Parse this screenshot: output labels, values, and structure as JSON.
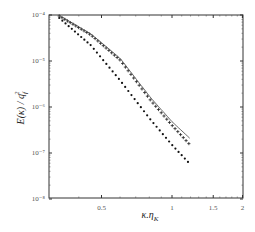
{
  "chart_data": {
    "type": "line",
    "title": "",
    "xlabel": "κ.η_K",
    "ylabel": "E(κ) / q_f^2",
    "xscale": "log",
    "yscale": "log",
    "xlim": [
      0.3,
      2
    ],
    "ylim": [
      1e-08,
      0.0001
    ],
    "x_ticks": [
      0.5,
      1,
      1.5,
      2
    ],
    "x_tick_labels": [
      "0.5",
      "1",
      "1.5",
      "2"
    ],
    "y_ticks": [
      0.0001,
      1e-05,
      1e-06,
      1e-07,
      1e-08
    ],
    "y_tick_labels": [
      "10⁻⁴",
      "10⁻⁵",
      "10⁻⁶",
      "10⁻⁷",
      "10⁻⁸"
    ],
    "grid": false,
    "legend": null,
    "series": [
      {
        "name": "crosses",
        "marker": "+",
        "x": [
          0.33,
          0.45,
          0.6,
          0.81,
          1.0,
          1.18
        ],
        "values": [
          9.5e-05,
          3.7e-05,
          1.05e-05,
          1.4e-06,
          4e-07,
          1.6e-07
        ]
      },
      {
        "name": "solid line",
        "marker": "none",
        "x": [
          0.33,
          0.45,
          0.6,
          0.81,
          1.0,
          1.19
        ],
        "values": [
          9.8e-05,
          3.9e-05,
          1.15e-05,
          1.6e-06,
          4.8e-07,
          2.1e-07
        ]
      },
      {
        "name": "dots",
        "marker": ".",
        "x": [
          0.33,
          0.45,
          0.6,
          0.81,
          1.0,
          1.17
        ],
        "values": [
          8.6e-05,
          2.2e-05,
          3.8e-06,
          5.3e-07,
          1.5e-07,
          6.4e-08
        ]
      }
    ]
  },
  "labels": {
    "x_axis": "κ.η",
    "x_sub": "K",
    "y_axis": "E(κ) / q",
    "y_sub": "f",
    "y_sup": "2"
  }
}
